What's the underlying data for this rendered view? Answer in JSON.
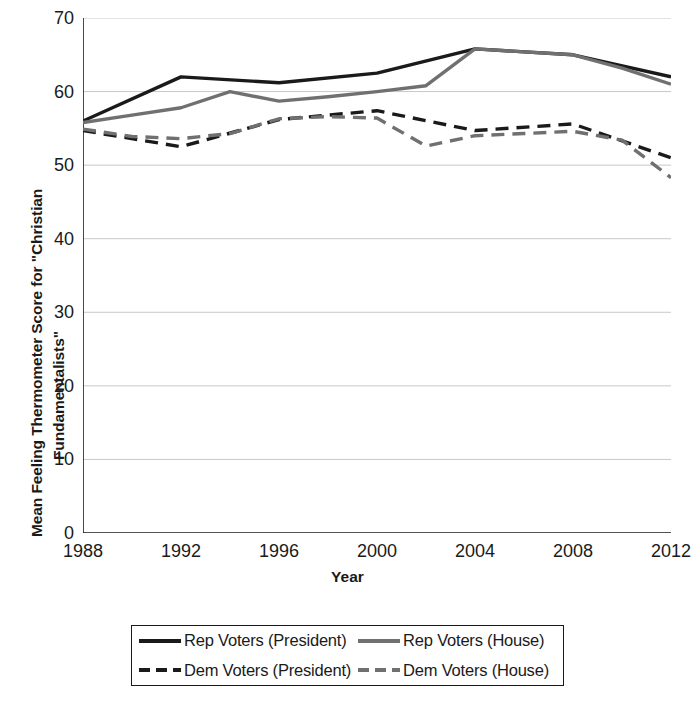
{
  "chart_data": {
    "type": "line",
    "title": "",
    "xlabel": "Year",
    "ylabel": "Mean Feeling Thermometer Score for \"Christian Fundamentalists\"",
    "ylabel_lines": [
      "Mean Feeling Thermometer Score for \"Christian",
      "Fundamentalists\""
    ],
    "xlim": [
      1988,
      2012
    ],
    "ylim": [
      0,
      70
    ],
    "yticks": [
      0,
      10,
      20,
      30,
      40,
      50,
      60,
      70
    ],
    "xticks": [
      1988,
      1992,
      1996,
      2000,
      2004,
      2008,
      2012
    ],
    "grid": "horizontal",
    "legend_position": "below-center",
    "series": [
      {
        "name": "Rep Voters (President)",
        "color": "#1a1a1a",
        "style": "solid",
        "x": [
          1988,
          1992,
          1996,
          2000,
          2004,
          2008,
          2012
        ],
        "values": [
          56.0,
          62.0,
          61.2,
          62.5,
          65.8,
          65.0,
          62.0
        ]
      },
      {
        "name": "Rep Voters (House)",
        "color": "#707070",
        "style": "solid",
        "x": [
          1988,
          1990,
          1992,
          1994,
          1996,
          1998,
          2000,
          2002,
          2004,
          2006,
          2008,
          2010,
          2012
        ],
        "values": [
          55.8,
          56.8,
          57.8,
          60.0,
          58.7,
          59.3,
          60.0,
          60.8,
          65.8,
          65.4,
          65.0,
          63.2,
          61.0
        ]
      },
      {
        "name": "Dem Voters (President)",
        "color": "#1a1a1a",
        "style": "dashed",
        "x": [
          1988,
          1992,
          1996,
          2000,
          2004,
          2008,
          2012
        ],
        "values": [
          54.7,
          52.5,
          56.2,
          57.4,
          54.7,
          55.6,
          51.0
        ]
      },
      {
        "name": "Dem Voters (House)",
        "color": "#707070",
        "style": "dashed",
        "x": [
          1988,
          1990,
          1992,
          1994,
          1996,
          1998,
          2000,
          2002,
          2004,
          2006,
          2008,
          2010,
          2012
        ],
        "values": [
          54.9,
          53.9,
          53.6,
          54.3,
          56.3,
          56.6,
          56.4,
          52.6,
          54.0,
          54.3,
          54.6,
          53.4,
          48.3
        ]
      }
    ]
  },
  "axes": {
    "ytitle_line1": "Mean Feeling Thermometer Score for \"Christian",
    "ytitle_line2": "Fundamentalists\"",
    "xtitle": "Year"
  },
  "legend": {
    "items": [
      {
        "label": "Rep Voters (President)",
        "color": "#1a1a1a",
        "style": "solid"
      },
      {
        "label": "Rep Voters (House)",
        "color": "#707070",
        "style": "solid"
      },
      {
        "label": "Dem Voters (President)",
        "color": "#1a1a1a",
        "style": "dashed"
      },
      {
        "label": "Dem Voters (House)",
        "color": "#707070",
        "style": "dashed"
      }
    ]
  },
  "colors": {
    "president": "#1a1a1a",
    "house": "#707070",
    "grid": "#c8c8c8",
    "axis": "#1a1a1a",
    "background": "#ffffff"
  }
}
